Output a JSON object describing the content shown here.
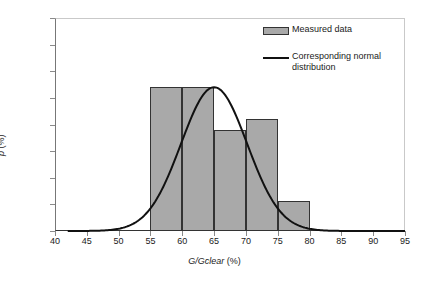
{
  "chart_data": {
    "type": "bar",
    "title": "",
    "subtitle": "",
    "xlabel": "G/Gclear (%)",
    "xlabel_italic": "G/Gclear",
    "xlabel_unit": " (%)",
    "ylabel": "p (%)",
    "ylabel_italic": "p",
    "ylabel_unit": " (%)",
    "xlim": [
      40,
      95
    ],
    "ylim": [
      0,
      40
    ],
    "xticks": [
      40,
      45,
      50,
      55,
      60,
      65,
      70,
      75,
      80,
      85,
      90,
      95
    ],
    "yticks": [
      0,
      5,
      10,
      15,
      20,
      25,
      30,
      35,
      40
    ],
    "grid": false,
    "legend_position": "top-right",
    "bin_edges": [
      55,
      60,
      65,
      70,
      75,
      80
    ],
    "categories": [
      "55-60",
      "60-65",
      "65-70",
      "70-75",
      "75-80"
    ],
    "values": [
      27,
      27,
      19,
      21,
      5.7
    ],
    "bar_color": "#a9a9a9",
    "bar_edge_color": "#333333",
    "series": [
      {
        "name": "Measured data",
        "type": "bar",
        "values": [
          27,
          27,
          19,
          21,
          5.7
        ]
      },
      {
        "name": "Corresponding normal distribution",
        "type": "line",
        "color": "#111111",
        "mean": 65,
        "sigma": 5.2,
        "peak": 27,
        "x": [
          42,
          45,
          48,
          50,
          52,
          54,
          55,
          56,
          58,
          60,
          62,
          64,
          65,
          66,
          68,
          70,
          72,
          74,
          75,
          76,
          78,
          80,
          82,
          85
        ],
        "y": [
          0.0,
          0.1,
          0.3,
          0.7,
          1.5,
          3.1,
          4.3,
          5.8,
          10.0,
          15.2,
          20.5,
          24.8,
          26.5,
          27.0,
          24.1,
          19.4,
          13.6,
          8.2,
          6.0,
          4.2,
          1.8,
          0.6,
          0.15,
          0.0
        ]
      }
    ]
  },
  "legend": {
    "items": [
      {
        "label": "Measured data",
        "marker": "swatch"
      },
      {
        "label": "Corresponding normal distribution",
        "marker": "line"
      }
    ]
  },
  "axis_colors": {
    "tick_label": "#1a1a1a",
    "axis_line": "#333333",
    "frame": "#c9c9c9"
  }
}
